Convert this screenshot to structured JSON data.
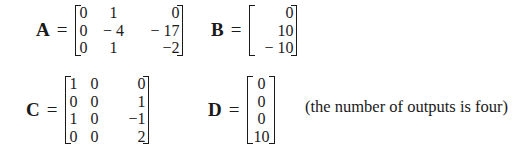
{
  "equations": {
    "A": {
      "label": "A",
      "equals": "=",
      "rows": [
        [
          "0",
          "1",
          "0"
        ],
        [
          "0",
          "− 4",
          "− 17"
        ],
        [
          "0",
          "1",
          "−2"
        ]
      ]
    },
    "B": {
      "label": "B",
      "equals": "=",
      "rows": [
        [
          "0"
        ],
        [
          "10"
        ],
        [
          "− 10"
        ]
      ]
    },
    "C": {
      "label": "C",
      "equals": "=",
      "rows": [
        [
          "1",
          "0",
          "0"
        ],
        [
          "0",
          "0",
          "1"
        ],
        [
          "1",
          "0",
          "−1"
        ],
        [
          "0",
          "0",
          "2"
        ]
      ]
    },
    "D": {
      "label": "D",
      "equals": "=",
      "rows": [
        [
          "0"
        ],
        [
          "0"
        ],
        [
          "0"
        ],
        [
          "10"
        ]
      ]
    }
  },
  "note": "(the number of outputs is four)"
}
